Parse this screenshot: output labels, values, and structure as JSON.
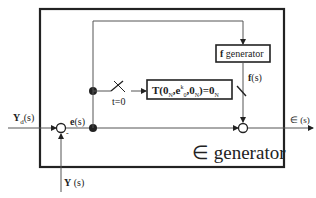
{
  "diagram": {
    "outer_block": {
      "label": "∈ generator"
    },
    "blocks": [
      {
        "id": "f_generator",
        "label_bold": "f",
        "label_rest": " generator"
      },
      {
        "id": "T_block",
        "label": "T(0N,e k 0,0N)=0N"
      }
    ],
    "signals": {
      "input_desired": "Y",
      "input_desired_sub": "d",
      "input_desired_arg": "(s)",
      "measured_output": "Y",
      "measured_output_arg": " (s)",
      "error": "e",
      "error_arg": "(s)",
      "f_signal": "f",
      "f_signal_arg": "(s)",
      "output": "∈ (s)"
    },
    "switch_label": "t=0",
    "summing_junction_1_sign": "-",
    "t_block_parts": {
      "T": "T(",
      "zero1": "0",
      "N1": "N",
      "comma1": ",",
      "e": "e",
      "k": "k",
      "zero_sub": "0",
      "comma2": ",",
      "zero2": "0",
      "N2": "N",
      "close": ")=",
      "zero3": "0",
      "N3": "N"
    },
    "colors": {
      "line": "#222222",
      "background": "#ffffff"
    }
  }
}
